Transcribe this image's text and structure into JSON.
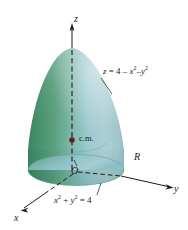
{
  "figure": {
    "background_color": "#ffffff",
    "axes": {
      "z_label": "z",
      "y_label": "y",
      "x_label": "x",
      "origin_label": "O"
    },
    "labels": {
      "center_of_mass": "c.m.",
      "region": "R"
    },
    "equations": {
      "surface": {
        "text": "z = 4 − x² − y²",
        "lhs": "z",
        "eq": "=",
        "const": "4",
        "minus1": "–",
        "term1_base": "x",
        "term1_exp": "2",
        "minus2": "–",
        "term2_base": "y",
        "term2_exp": "2"
      },
      "base_circle": {
        "text": "x² + y² = 4",
        "term1_base": "x",
        "term1_exp": "2",
        "plus": "+",
        "term2_base": "y",
        "term2_exp": "2",
        "eq": "=",
        "rhs": "4"
      }
    },
    "colors": {
      "surface_dark_green": "#3f8a66",
      "surface_mid_green": "#63a98a",
      "surface_light_teal": "#a9d0d6",
      "surface_highlight": "#c5dfe2",
      "base_ellipse": "#8fc3cb",
      "base_ellipse_shade": "#6ba8ae",
      "axis_line": "#1a1a1a",
      "dash_line": "#1a1a1a",
      "cm_dot": "#5c1f1f",
      "text": "#1a1a1a"
    },
    "geometry": {
      "apex": [
        72,
        48
      ],
      "origin": [
        76,
        171
      ],
      "base_rx": 49,
      "base_ry": 15,
      "cm_point": [
        72,
        140
      ],
      "z_axis_top": [
        72,
        24
      ],
      "y_axis_end": [
        172,
        188
      ],
      "x_axis_end": [
        20,
        210
      ]
    }
  }
}
